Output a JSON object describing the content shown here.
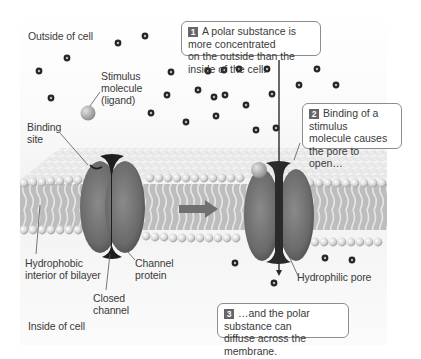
{
  "diagram": {
    "regions": {
      "outside": "Outside of cell",
      "inside": "Inside of cell"
    },
    "labels": {
      "stimulus": "Stimulus\nmolecule\n(ligand)",
      "binding_site": "Binding\nsite",
      "hydrophobic": "Hydrophobic\ninterior of bilayer",
      "channel_protein": "Channel\nprotein",
      "closed_channel": "Closed\nchannel",
      "hydrophilic_pore": "Hydrophilic pore"
    },
    "callouts": [
      {
        "step": "1",
        "text": "A polar substance is more concentrated\non the outside than the inside of the cell."
      },
      {
        "step": "2",
        "text": "Binding of a stimulus\nmolecule causes\nthe pore to open…"
      },
      {
        "step": "3",
        "text": "…and the polar substance can\ndiffuse across the membrane."
      }
    ],
    "transition_arrow": "right-arrow",
    "colors": {
      "protein": "#6e6e6e",
      "protein_dark": "#2c2c2c",
      "lipid_head": "#d8d8d8",
      "molecule": "#2a2a2a",
      "ligand": "#a9a9a9",
      "arrow": "#707070",
      "badge": "#666666"
    }
  }
}
